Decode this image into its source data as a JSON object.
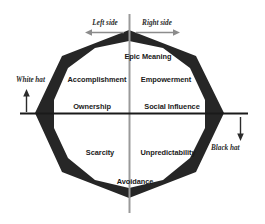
{
  "diagram": {
    "name": "Octalysis core drives octagon",
    "colors": {
      "band": "#262626",
      "axis_main": "#1a1a1a",
      "axis_vertical": "#9a9a9a",
      "arrow_gray": "#8c8c8c",
      "arrow_dark": "#2b2b2b",
      "background": "#ffffff",
      "text": "#1a1a1a"
    }
  },
  "axes": {
    "top_left": {
      "label": "Left side",
      "arrow": "arrow-left-icon"
    },
    "top_right": {
      "label": "Right side",
      "arrow": "arrow-right-icon"
    },
    "left": {
      "label": "White hat",
      "arrow": "arrow-up-icon"
    },
    "right": {
      "label": "Black hat",
      "arrow": "arrow-down-icon"
    }
  },
  "core_drives": [
    {
      "id": "epic-meaning",
      "label": "Epic Meaning",
      "position": "top-center"
    },
    {
      "id": "accomplishment",
      "label": "Accomplishment",
      "position": "upper-left"
    },
    {
      "id": "empowerment",
      "label": "Empowerment",
      "position": "upper-right"
    },
    {
      "id": "ownership",
      "label": "Ownership",
      "position": "middle-left"
    },
    {
      "id": "social-influence",
      "label": "Social Influence",
      "position": "middle-right"
    },
    {
      "id": "scarcity",
      "label": "Scarcity",
      "position": "lower-left"
    },
    {
      "id": "unpredictability",
      "label": "Unpredictability",
      "position": "lower-right"
    },
    {
      "id": "avoidance",
      "label": "Avoidance",
      "position": "bottom-center"
    }
  ]
}
